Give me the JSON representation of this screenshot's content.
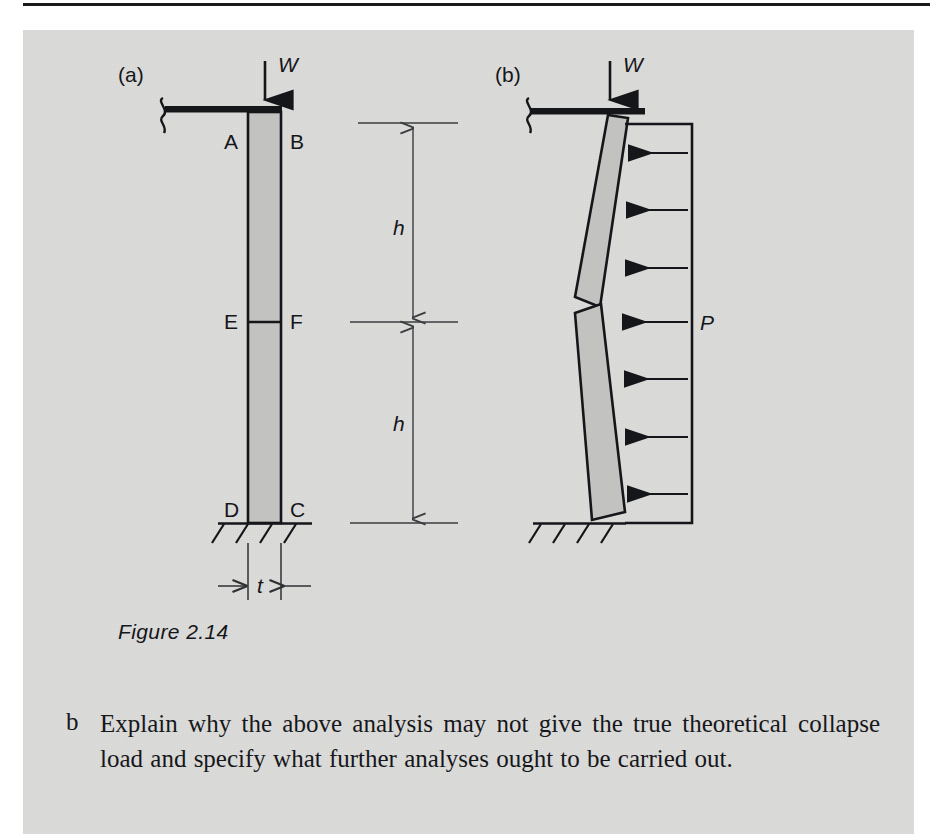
{
  "page": {
    "background_color": "#dcdcda",
    "ink_color": "#15161a",
    "shade_color": "#c2c2c0"
  },
  "figure": {
    "caption": "Figure 2.14",
    "panels": [
      {
        "id": "a",
        "label": "(a)",
        "description": "undeformed masonry wall panel with applied vertical load",
        "load_label": "W",
        "corner_labels": [
          "A",
          "B",
          "E",
          "F",
          "D",
          "C"
        ],
        "thickness_label": "t",
        "height_labels": [
          "h",
          "h"
        ]
      },
      {
        "id": "b",
        "label": "(b)",
        "description": "collapse mechanism with three hinges under lateral pressure",
        "load_label": "W",
        "pressure_label": "P",
        "pressure_arrow_count": 7
      }
    ]
  },
  "question": {
    "marker": "b",
    "text": "Explain why the above analysis may not give the true theoretical collapse load and specify what further analyses ought to be carried out."
  }
}
